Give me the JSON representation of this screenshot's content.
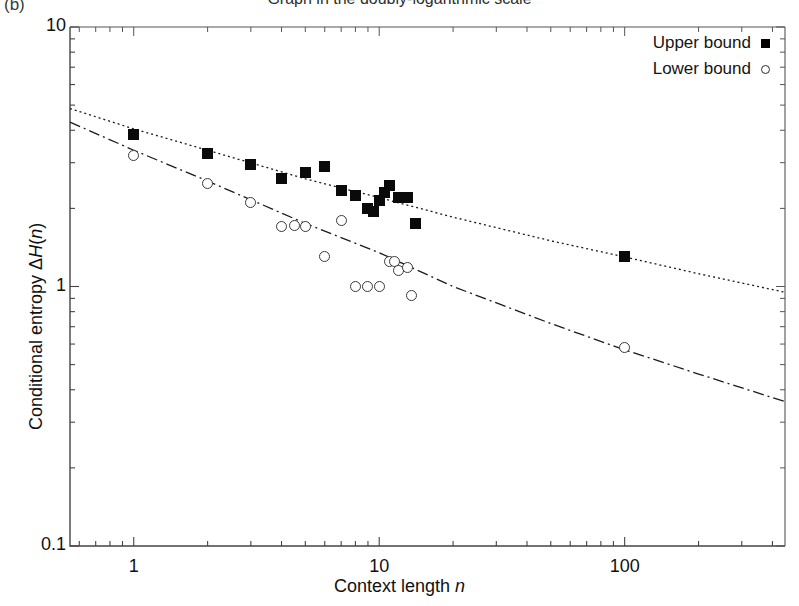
{
  "panel": {
    "label": "(b)"
  },
  "title": {
    "text": "Graph in the doubly-logarithmic scale"
  },
  "legend": {
    "entries": [
      {
        "label": "Upper bound",
        "marker": "filled-square-marker"
      },
      {
        "label": "Lower bound",
        "marker": "open-circle-marker"
      }
    ]
  },
  "axes": {
    "xlabel_prefix": "Context length ",
    "xlabel_var": "n",
    "ylabel_prefix": "Conditional entropy ",
    "ylabel_var": "ΔH(n)",
    "xticks": [
      "1",
      "10",
      "100"
    ],
    "yticks": [
      "10",
      "1",
      "0.1"
    ]
  },
  "chart_data": {
    "type": "scatter",
    "title": "Graph in the doubly-logarithmic scale",
    "xlabel": "Context length n",
    "ylabel": "Conditional entropy ΔH(n)",
    "xscale": "log",
    "yscale": "log",
    "xlim": [
      0.55,
      450
    ],
    "ylim": [
      0.1,
      10
    ],
    "grid": false,
    "legend_position": "top-right",
    "series": [
      {
        "name": "Upper bound",
        "marker": "filled-square",
        "points": [
          [
            1,
            3.85
          ],
          [
            2,
            3.25
          ],
          [
            3,
            2.95
          ],
          [
            4,
            2.6
          ],
          [
            5,
            2.75
          ],
          [
            6,
            2.9
          ],
          [
            7,
            2.35
          ],
          [
            8,
            2.25
          ],
          [
            9,
            2.0
          ],
          [
            9.5,
            1.95
          ],
          [
            10,
            2.15
          ],
          [
            10.5,
            2.3
          ],
          [
            11,
            2.45
          ],
          [
            12,
            2.2
          ],
          [
            13,
            2.2
          ],
          [
            14,
            1.75
          ],
          [
            100,
            1.3
          ]
        ]
      },
      {
        "name": "Lower bound",
        "marker": "open-circle",
        "points": [
          [
            1,
            3.2
          ],
          [
            2,
            2.5
          ],
          [
            3,
            2.1
          ],
          [
            4,
            1.7
          ],
          [
            4.5,
            1.72
          ],
          [
            5,
            1.7
          ],
          [
            6,
            1.3
          ],
          [
            7,
            1.8
          ],
          [
            8,
            1.0
          ],
          [
            9,
            1.0
          ],
          [
            10,
            1.0
          ],
          [
            11,
            1.25
          ],
          [
            11.5,
            1.25
          ],
          [
            12,
            1.15
          ],
          [
            13,
            1.18
          ],
          [
            13.5,
            0.92
          ],
          [
            100,
            0.58
          ]
        ]
      }
    ],
    "fit_curves": [
      {
        "name": "upper-bound-fit",
        "style": "dotted",
        "points": [
          [
            0.55,
            4.85
          ],
          [
            1,
            4.05
          ],
          [
            2,
            3.35
          ],
          [
            5,
            2.6
          ],
          [
            10,
            2.2
          ],
          [
            20,
            1.85
          ],
          [
            50,
            1.5
          ],
          [
            100,
            1.3
          ],
          [
            200,
            1.12
          ],
          [
            450,
            0.95
          ]
        ]
      },
      {
        "name": "lower-bound-fit",
        "style": "dash-dot",
        "points": [
          [
            0.55,
            4.3
          ],
          [
            1,
            3.35
          ],
          [
            2,
            2.55
          ],
          [
            5,
            1.75
          ],
          [
            10,
            1.35
          ],
          [
            20,
            1.0
          ],
          [
            50,
            0.72
          ],
          [
            100,
            0.57
          ],
          [
            200,
            0.46
          ],
          [
            450,
            0.36
          ]
        ]
      }
    ]
  }
}
